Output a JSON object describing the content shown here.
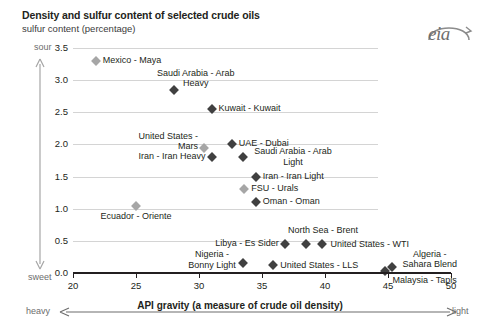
{
  "header": {
    "title": "Density and sulfur content of selected crude oils",
    "subtitle": "sulfur content (percentage)",
    "logo_text": "eia"
  },
  "axis_annotations": {
    "sour": "sour",
    "sweet": "sweet",
    "heavy": "heavy",
    "light": "light",
    "x_caption": "API gravity (a measure of crude oil density)"
  },
  "chart_data": {
    "type": "scatter",
    "title": "Density and sulfur content of selected crude oils",
    "subtitle": "sulfur content (percentage)",
    "xlabel": "API gravity (a measure of crude oil density)",
    "ylabel": "sulfur content (percentage)",
    "xlim": [
      20,
      50
    ],
    "ylim": [
      0.0,
      3.5
    ],
    "xticks": [
      "20",
      "25",
      "30",
      "35",
      "40",
      "45",
      "50"
    ],
    "yticks": [
      "0.0",
      "0.5",
      "1.0",
      "1.5",
      "2.0",
      "2.5",
      "3.0",
      "3.5"
    ],
    "grid": "horizontal",
    "legend": "none",
    "points": [
      {
        "label": "Mexico - Maya",
        "x": 21.8,
        "y": 3.3,
        "marker": "light",
        "label_pos": "right"
      },
      {
        "label": "Saudi Arabia - Arab Heavy",
        "x": 28.0,
        "y": 2.85,
        "marker": "dark",
        "label_pos": "above-right"
      },
      {
        "label": "Kuwait - Kuwait",
        "x": 31.0,
        "y": 2.55,
        "marker": "dark",
        "label_pos": "right"
      },
      {
        "label": "United States - Mars",
        "x": 30.4,
        "y": 1.95,
        "marker": "light",
        "label_pos": "left"
      },
      {
        "label": "UAE - Dubai",
        "x": 32.6,
        "y": 2.0,
        "marker": "dark",
        "label_pos": "right"
      },
      {
        "label": "Iran - Iran Heavy",
        "x": 31.0,
        "y": 1.8,
        "marker": "dark",
        "label_pos": "left"
      },
      {
        "label": "Saudi Arabia - Arab Light",
        "x": 33.5,
        "y": 1.8,
        "marker": "dark",
        "label_pos": "right"
      },
      {
        "label": "Iran - Iran Light",
        "x": 34.5,
        "y": 1.5,
        "marker": "dark",
        "label_pos": "right"
      },
      {
        "label": "FSU - Urals",
        "x": 33.6,
        "y": 1.3,
        "marker": "light",
        "label_pos": "right"
      },
      {
        "label": "Oman - Oman",
        "x": 34.5,
        "y": 1.1,
        "marker": "dark",
        "label_pos": "right"
      },
      {
        "label": "Ecuador - Oriente",
        "x": 25.0,
        "y": 1.05,
        "marker": "light",
        "label_pos": "below"
      },
      {
        "label": "North Sea - Brent",
        "x": 38.5,
        "y": 0.45,
        "marker": "dark",
        "label_pos": "above-right"
      },
      {
        "label": "United States - WTI",
        "x": 39.8,
        "y": 0.45,
        "marker": "dark",
        "label_pos": "right"
      },
      {
        "label": "Libya - Es Sider",
        "x": 36.8,
        "y": 0.45,
        "marker": "dark",
        "label_pos": "left"
      },
      {
        "label": "Nigeria - Bonny Light",
        "x": 33.5,
        "y": 0.15,
        "marker": "dark",
        "label_pos": "left"
      },
      {
        "label": "United States - LLS",
        "x": 35.9,
        "y": 0.12,
        "marker": "dark",
        "label_pos": "right"
      },
      {
        "label": "Algeria - Sahara Blend",
        "x": 45.3,
        "y": 0.1,
        "marker": "dark",
        "label_pos": "above-right"
      },
      {
        "label": "Malaysia - Tapis",
        "x": 44.8,
        "y": 0.03,
        "marker": "dark",
        "label_pos": "right"
      }
    ]
  }
}
